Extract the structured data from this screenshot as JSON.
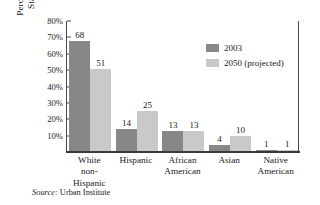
{
  "chart_data": {
    "type": "bar",
    "title": "",
    "xlabel": "",
    "ylabel_line1": "Percentage of United",
    "ylabel_line2": "States Population",
    "ylabel": "Percentage of United States Population",
    "categories": [
      {
        "line1": "White",
        "line2": "non-",
        "line3": "Hispanic"
      },
      {
        "line1": "Hispanic",
        "line2": "",
        "line3": ""
      },
      {
        "line1": "African",
        "line2": "American",
        "line3": ""
      },
      {
        "line1": "Asian",
        "line2": "",
        "line3": ""
      },
      {
        "line1": "Native",
        "line2": "American",
        "line3": ""
      }
    ],
    "category_names": [
      "White non-Hispanic",
      "Hispanic",
      "African American",
      "Asian",
      "Native American"
    ],
    "series": [
      {
        "name": "2003",
        "color": "#878787",
        "values": [
          68,
          14,
          13,
          4,
          1
        ]
      },
      {
        "name": "2050 (projected)",
        "color": "#c9c9c9",
        "values": [
          51,
          25,
          13,
          10,
          1
        ]
      }
    ],
    "ylim": [
      0,
      80
    ],
    "ytick_values": [
      80,
      70,
      60,
      50,
      40,
      30,
      20,
      10
    ],
    "ytick_labels": [
      "80%",
      "70%",
      "60%",
      "50%",
      "40%",
      "30%",
      "20%",
      "10%"
    ],
    "grid": false,
    "legend_position": "inside-top-right",
    "value_labels": true
  },
  "legend": {
    "entries": [
      {
        "label": "2003",
        "color": "#878787"
      },
      {
        "label": "2050 (projected)",
        "color": "#c9c9c9"
      }
    ]
  },
  "source": {
    "keyword": "Source:",
    "text": " Urban Institute"
  }
}
